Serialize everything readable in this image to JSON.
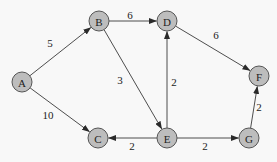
{
  "diagram": {
    "type": "directed-weighted-graph",
    "colors": {
      "background": "#f8f8f8",
      "node_fill": "#bdbdbd",
      "node_stroke": "#555555",
      "edge": "#3a3a3a",
      "text": "#222222"
    },
    "nodes": [
      {
        "id": "A",
        "label": "A",
        "x": 22,
        "y": 82
      },
      {
        "id": "B",
        "label": "B",
        "x": 99,
        "y": 21
      },
      {
        "id": "D",
        "label": "D",
        "x": 167,
        "y": 21
      },
      {
        "id": "F",
        "label": "F",
        "x": 259,
        "y": 76
      },
      {
        "id": "C",
        "label": "C",
        "x": 98,
        "y": 138
      },
      {
        "id": "E",
        "label": "E",
        "x": 167,
        "y": 138
      },
      {
        "id": "G",
        "label": "G",
        "x": 249,
        "y": 138
      }
    ],
    "edges": [
      {
        "from": "A",
        "to": "B",
        "weight": "5",
        "label_x": 50,
        "label_y": 43
      },
      {
        "from": "A",
        "to": "C",
        "weight": "10",
        "label_x": 48,
        "label_y": 115
      },
      {
        "from": "B",
        "to": "D",
        "weight": "6",
        "label_x": 130,
        "label_y": 15
      },
      {
        "from": "B",
        "to": "E",
        "weight": "3",
        "label_x": 120,
        "label_y": 80
      },
      {
        "from": "D",
        "to": "F",
        "weight": "6",
        "label_x": 216,
        "label_y": 35
      },
      {
        "from": "E",
        "to": "D",
        "weight": "2",
        "label_x": 174,
        "label_y": 82
      },
      {
        "from": "E",
        "to": "C",
        "weight": "2",
        "label_x": 132,
        "label_y": 146
      },
      {
        "from": "E",
        "to": "G",
        "weight": "2",
        "label_x": 205,
        "label_y": 146
      },
      {
        "from": "G",
        "to": "F",
        "weight": "2",
        "label_x": 259,
        "label_y": 107
      }
    ],
    "node_radius": 10
  }
}
